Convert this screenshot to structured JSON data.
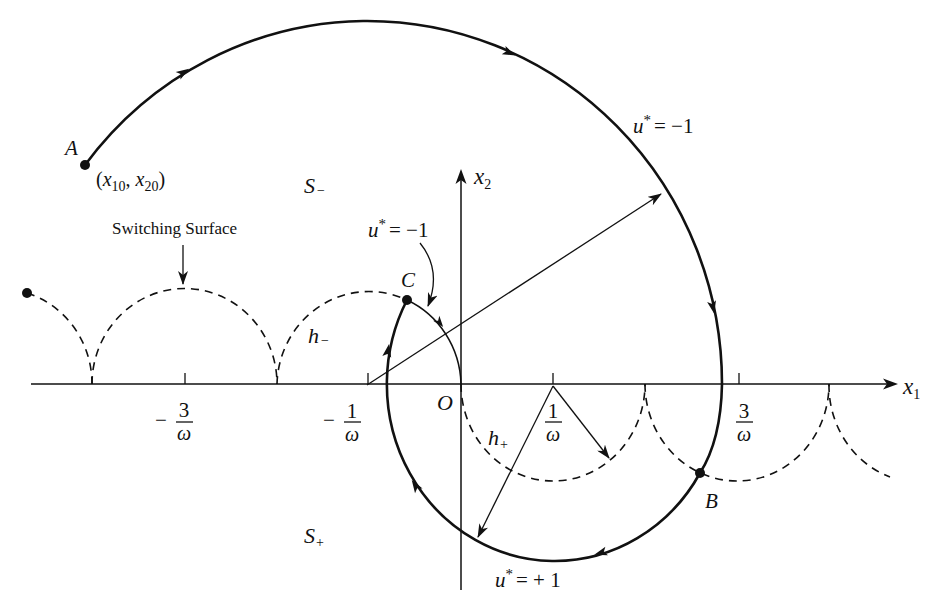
{
  "figure": {
    "axes": {
      "x1": {
        "var": "x",
        "sub": "1"
      },
      "x2": {
        "var": "x",
        "sub": "2"
      },
      "origin": "O"
    },
    "ticks": [
      {
        "sign": "−",
        "num": "3",
        "den": "ω"
      },
      {
        "sign": "−",
        "num": "1",
        "den": "ω"
      },
      {
        "sign": "",
        "num": "1",
        "den": "ω"
      },
      {
        "sign": "",
        "num": "3",
        "den": "ω"
      }
    ],
    "points": {
      "a": {
        "label": "A",
        "open": "(",
        "x1": "x",
        "x1_sub": "10",
        "sep": ", ",
        "x2": "x",
        "x2_sub": "20",
        "close": ")"
      },
      "b": {
        "label": "B"
      },
      "c": {
        "label": "C"
      }
    },
    "regions": {
      "s_minus": {
        "var": "S",
        "sub": "−"
      },
      "s_plus": {
        "var": "S",
        "sub": "+"
      }
    },
    "curves": {
      "h_minus": {
        "var": "h",
        "sub": "−"
      },
      "h_plus": {
        "var": "h",
        "sub": "+"
      }
    },
    "controls": {
      "upper": {
        "var": "u",
        "sup": "*",
        "rhs": "= −1"
      },
      "middle": {
        "var": "u",
        "sup": "*",
        "rhs": "= −1"
      },
      "lower": {
        "var": "u",
        "sup": "*",
        "rhs": "= + 1"
      }
    },
    "annotations": {
      "switching_surface": "Switching Surface"
    },
    "colors": {
      "ink": "#111111",
      "background": "#ffffff"
    }
  }
}
